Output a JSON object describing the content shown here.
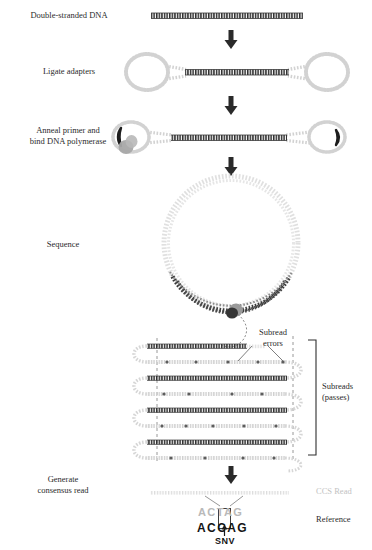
{
  "figure": {
    "colors": {
      "dna_dark": "#2b2b2b",
      "adapter_gray": "#c9c9c9",
      "light_gray": "#d7d7d7",
      "arrow_dark": "#2a2a2a",
      "ccs_text_gray": "#bdbdbd",
      "reference_text": "#141414",
      "polymerase_gray": "#9a9a9a"
    },
    "steps": [
      {
        "id": "step-dsdna",
        "label": "Double-stranded DNA"
      },
      {
        "id": "step-ligate",
        "label": "Ligate adapters"
      },
      {
        "id": "step-anneal",
        "label": "Anneal primer and\nbind DNA polymerase"
      },
      {
        "id": "step-sequence",
        "label": "Sequence"
      },
      {
        "id": "step-consensus",
        "label": "Generate\nconsensus read"
      }
    ],
    "annotations": {
      "subread_errors": "Subread\nerrors",
      "subreads_passes": "Subreads\n(passes)",
      "ccs_read": "CCS Read",
      "reference": "Reference",
      "snv": "SNV"
    },
    "alignment": {
      "ccs_read_bases": "ACTAG",
      "reference_bases": "ACCAG",
      "variant_position": 3,
      "ccs_variant_base": "T",
      "reference_variant_base": "C"
    },
    "subreads": {
      "pass_count": 5,
      "error_marker_count": 2
    },
    "arrows": [
      {
        "id": "arrow-1",
        "from": "step-dsdna",
        "to": "step-ligate"
      },
      {
        "id": "arrow-2",
        "from": "step-ligate",
        "to": "step-anneal"
      },
      {
        "id": "arrow-3",
        "from": "step-anneal",
        "to": "step-sequence"
      },
      {
        "id": "arrow-4",
        "from": "subreads",
        "to": "step-consensus"
      }
    ]
  }
}
